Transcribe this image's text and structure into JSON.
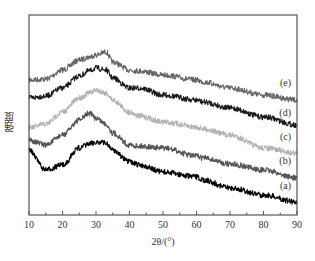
{
  "chart_data": {
    "type": "line",
    "title": "",
    "xlabel": "2θ/(°)",
    "ylabel": "强度",
    "xlim": [
      10,
      90
    ],
    "x_ticks": [
      10,
      20,
      30,
      40,
      50,
      60,
      70,
      80,
      90
    ],
    "y_ticks": [],
    "grid": false,
    "legend_position": "inline-right",
    "x": [
      10,
      15,
      20,
      25,
      28,
      30,
      33,
      35,
      40,
      43,
      50,
      60,
      62,
      70,
      80,
      90
    ],
    "series": [
      {
        "name": "(e)",
        "color": "#666666",
        "label_y_px": 86,
        "pixel_y": [
          80,
          79,
          70,
          60,
          57,
          55,
          52,
          62,
          70,
          71,
          75,
          80,
          82,
          88,
          95,
          100
        ]
      },
      {
        "name": "(d)",
        "color": "#1a1a1a",
        "label_y_px": 116,
        "pixel_y": [
          98,
          96,
          88,
          76,
          71,
          68,
          70,
          78,
          88,
          88,
          95,
          100,
          102,
          108,
          117,
          125
        ]
      },
      {
        "name": "(c)",
        "color": "#b3b3b3",
        "label_y_px": 140,
        "pixel_y": [
          128,
          124,
          112,
          98,
          93,
          90,
          93,
          100,
          112,
          116,
          122,
          127,
          129,
          135,
          148,
          153
        ]
      },
      {
        "name": "(b)",
        "color": "#555555",
        "label_y_px": 164,
        "pixel_y": [
          140,
          145,
          135,
          120,
          113,
          118,
          124,
          133,
          145,
          146,
          148,
          156,
          158,
          164,
          170,
          178
        ]
      },
      {
        "name": "(a)",
        "color": "#000000",
        "label_y_px": 189,
        "pixel_y": [
          150,
          170,
          165,
          148,
          144,
          142,
          143,
          150,
          162,
          165,
          172,
          177,
          180,
          188,
          195,
          202
        ]
      }
    ],
    "note": "Stacked XRD patterns, y offset (arbitrary intensity units, no y tick values); broad amorphous hump near 2θ≈30°, small features near 35°, 43° and 60°."
  },
  "plot": {
    "frame_px": {
      "left": 29,
      "top": 15,
      "right": 297,
      "bottom": 215
    },
    "axis_color": "#555555"
  }
}
